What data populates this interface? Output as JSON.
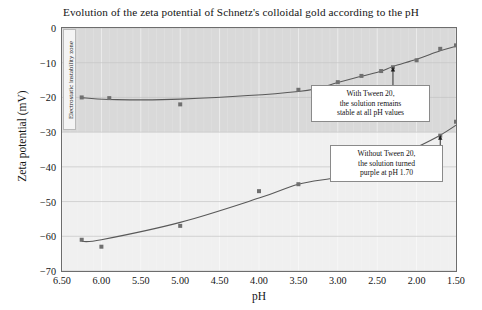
{
  "chart_data": {
    "type": "scatter",
    "title": "Evolution of the zeta potential of Schnetz's colloidal gold according to the pH",
    "xlabel": "pH",
    "ylabel": "Zeta potential (mV)",
    "xlim": [
      6.5,
      1.5
    ],
    "ylim": [
      -70,
      0
    ],
    "x_reversed": true,
    "xticks": [
      "6.50",
      "6.00",
      "5.50",
      "5.00",
      "4.50",
      "4.00",
      "3.50",
      "3.00",
      "2.50",
      "2.00",
      "1.50"
    ],
    "xtick_values": [
      6.5,
      6.0,
      5.5,
      5.0,
      4.5,
      4.0,
      3.5,
      3.0,
      2.5,
      2.0,
      1.5
    ],
    "yticks": [
      "0",
      "-10",
      "-20",
      "-30",
      "-40",
      "-50",
      "-60",
      "-70"
    ],
    "ytick_values": [
      0,
      -10,
      -20,
      -30,
      -40,
      -50,
      -60,
      -70
    ],
    "grid": true,
    "legend_position": "none",
    "series": [
      {
        "name": "With Tween 20",
        "marker_color": "#707070",
        "line_color": "#595959",
        "points": [
          {
            "x": 6.25,
            "y": -20.0
          },
          {
            "x": 5.9,
            "y": -20.2
          },
          {
            "x": 5.0,
            "y": -22.0
          },
          {
            "x": 3.5,
            "y": -17.8
          },
          {
            "x": 3.0,
            "y": -15.6
          },
          {
            "x": 2.7,
            "y": -13.8
          },
          {
            "x": 2.45,
            "y": -12.4
          },
          {
            "x": 2.3,
            "y": -11.3
          },
          {
            "x": 2.0,
            "y": -9.3
          },
          {
            "x": 1.7,
            "y": -6.0
          },
          {
            "x": 1.5,
            "y": -5.0
          }
        ]
      },
      {
        "name": "Without Tween 20",
        "marker_color": "#707070",
        "line_color": "#595959",
        "points": [
          {
            "x": 6.25,
            "y": -61.0
          },
          {
            "x": 6.0,
            "y": -63.0
          },
          {
            "x": 5.0,
            "y": -57.0
          },
          {
            "x": 4.0,
            "y": -47.0
          },
          {
            "x": 3.5,
            "y": -45.0
          },
          {
            "x": 3.0,
            "y": -43.0
          },
          {
            "x": 2.7,
            "y": -41.0
          },
          {
            "x": 2.3,
            "y": -37.5
          },
          {
            "x": 2.0,
            "y": -34.5
          },
          {
            "x": 1.7,
            "y": -31.0
          },
          {
            "x": 1.5,
            "y": -27.0
          }
        ]
      }
    ],
    "bands": [
      {
        "label": "Electrostatic instability zone",
        "y_from": 0,
        "y_to": -30,
        "color": "#d9d9d9"
      }
    ],
    "annotations": [
      {
        "id": "with-tween",
        "lines": [
          "With Tween 20,",
          "the solution remains",
          "stable at all pH values"
        ],
        "target_x": 2.3,
        "target_y": -11.3
      },
      {
        "id": "without-tween",
        "lines": [
          "Without Tween 20,",
          "the solution turned",
          "purple at pH 1.70"
        ],
        "target_x": 1.7,
        "target_y": -31.0
      }
    ]
  },
  "zone": {
    "label": "Electrostatic instability zone"
  },
  "annot_tween": {
    "line1": "With Tween 20,",
    "line2": "the solution remains",
    "line3": "stable at all pH values"
  },
  "annot_notween": {
    "line1": "Without Tween 20,",
    "line2": "the solution turned",
    "line3": "purple at pH 1.70"
  }
}
